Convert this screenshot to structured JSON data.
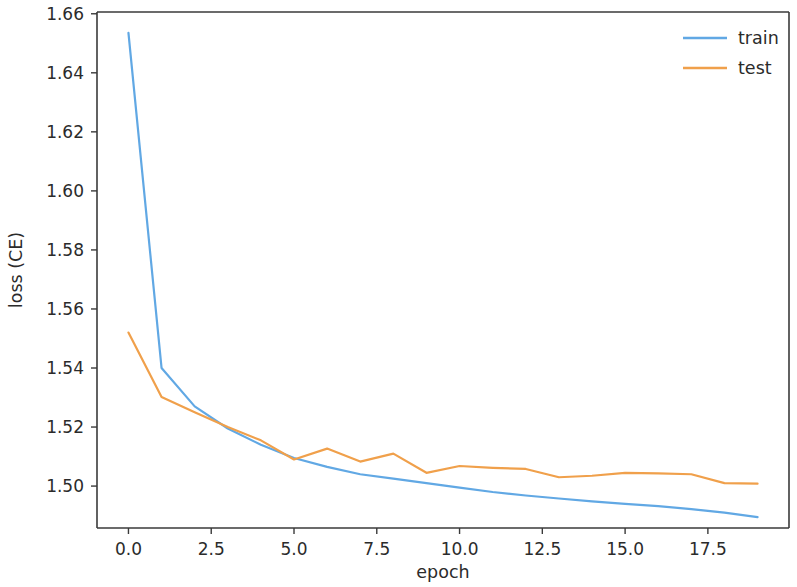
{
  "chart_data": {
    "type": "line",
    "title": "",
    "xlabel": "epoch",
    "ylabel": "loss (CE)",
    "xlim": [
      -0.95,
      19.95
    ],
    "ylim": [
      1.4858,
      1.6606
    ],
    "grid": false,
    "legend_position": "upper right",
    "xticks": [
      0.0,
      2.5,
      5.0,
      7.5,
      10.0,
      12.5,
      15.0,
      17.5
    ],
    "xticklabels": [
      "0.0",
      "2.5",
      "5.0",
      "7.5",
      "10.0",
      "12.5",
      "15.0",
      "17.5"
    ],
    "yticks": [
      1.5,
      1.52,
      1.54,
      1.56,
      1.58,
      1.6,
      1.62,
      1.64,
      1.66
    ],
    "yticklabels": [
      "1.50",
      "1.52",
      "1.54",
      "1.56",
      "1.58",
      "1.60",
      "1.62",
      "1.64",
      "1.66"
    ],
    "x": [
      0,
      1,
      2,
      3,
      4,
      5,
      6,
      7,
      8,
      9,
      10,
      11,
      12,
      13,
      14,
      15,
      16,
      17,
      18,
      19
    ],
    "series": [
      {
        "name": "train",
        "color": "#61a8e4",
        "values": [
          1.6535,
          1.54,
          1.527,
          1.5195,
          1.514,
          1.5095,
          1.5065,
          1.504,
          1.5025,
          1.501,
          1.4995,
          1.498,
          1.4968,
          1.4958,
          1.4948,
          1.494,
          1.4932,
          1.4922,
          1.491,
          1.4895
        ]
      },
      {
        "name": "test",
        "color": "#f0a04b",
        "values": [
          1.552,
          1.5302,
          1.525,
          1.52,
          1.5155,
          1.509,
          1.5127,
          1.5083,
          1.511,
          1.5045,
          1.5068,
          1.5062,
          1.5058,
          1.503,
          1.5035,
          1.5045,
          1.5043,
          1.504,
          1.501,
          1.5008
        ]
      }
    ]
  },
  "legend": {
    "entries": [
      {
        "label": "train",
        "color": "#61a8e4"
      },
      {
        "label": "test",
        "color": "#f0a04b"
      }
    ]
  },
  "axes": {
    "x_axis_label": "epoch",
    "y_axis_label": "loss (CE)"
  },
  "colors": {
    "train": "#61a8e4",
    "test": "#f0a04b",
    "spine": "#3a3a3a",
    "text": "#2b2b2b",
    "background": "#ffffff"
  }
}
